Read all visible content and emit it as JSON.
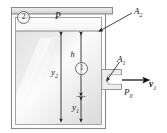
{
  "figure": {
    "colors": {
      "wall": "#8f8f8f",
      "fluid_light": "#f7f7f7",
      "fluid_dark": "#d8d8d8",
      "line": "#2b2b2b",
      "label": "#1a1a1a"
    }
  },
  "labels": {
    "pressure_tank": "P",
    "area_surface": "A",
    "area_surface_sub": "2",
    "area_outlet": "A",
    "area_outlet_sub": "1",
    "pressure_ambient": "P",
    "pressure_ambient_sub": "0",
    "velocity_outlet": "v",
    "velocity_outlet_sub": "1",
    "height_h": "h",
    "height_y2": "y",
    "height_y2_sub": "2",
    "height_y1": "y",
    "height_y1_sub": "1",
    "station_2": "2",
    "station_1": "1"
  }
}
